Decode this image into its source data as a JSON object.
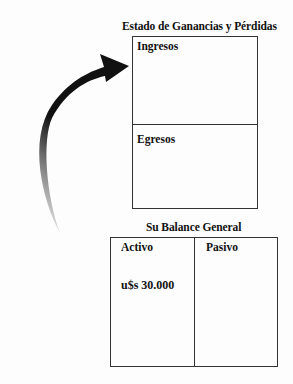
{
  "income_statement": {
    "title": "Estado de Ganancias y Pérdidas",
    "sections": [
      {
        "label": "Ingresos"
      },
      {
        "label": "Egresos"
      }
    ]
  },
  "balance_sheet": {
    "title": "Su Balance General",
    "columns": [
      {
        "label": "Activo",
        "value": "u$s 30.000"
      },
      {
        "label": "Pasivo",
        "value": ""
      }
    ]
  },
  "arrow": {
    "direction": "from balance sheet (bottom-left) curving up to income statement",
    "color": "#111111"
  }
}
